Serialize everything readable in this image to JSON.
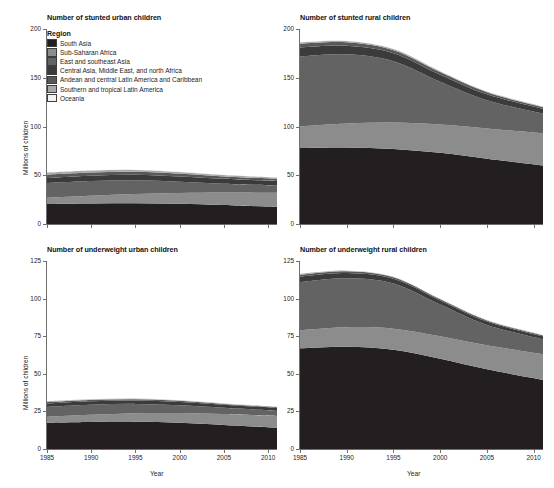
{
  "figure": {
    "ylabel": "Millions of children",
    "xlabel": "Year"
  },
  "legend": {
    "title": "Region",
    "items": [
      {
        "label": "South Asia",
        "color": "#231f20"
      },
      {
        "label": "Sub-Saharan Africa",
        "color": "#8c8c8c"
      },
      {
        "label": "East and southeast Asia",
        "color": "#636363"
      },
      {
        "label": "Central Asia, Middle East, and north Africa",
        "color": "#3b3b3b"
      },
      {
        "label": "Andean and central Latin America and Caribbean",
        "color": "#585858"
      },
      {
        "label": "Southern and tropical Latin America",
        "color": "#a8a8a8"
      },
      {
        "label": "Oceania",
        "color": "#f2f2f2"
      }
    ]
  },
  "chart_data": [
    {
      "type": "area",
      "id": "stunted-urban",
      "title": "Number of stunted urban children",
      "xlabel": "Year",
      "ylabel": "Millions of children",
      "x": [
        1985,
        1990,
        1995,
        2000,
        2005,
        2011
      ],
      "xlim": [
        1985,
        2011
      ],
      "ylim": [
        0,
        200
      ],
      "yticks": [
        0,
        50,
        100,
        150,
        200
      ],
      "xticks": [
        1985,
        1990,
        1995,
        2000,
        2005,
        2010
      ],
      "grid": false,
      "legend_position": "inside-top-left",
      "stacked": true,
      "series": [
        {
          "name": "South Asia",
          "color": "#231f20",
          "values": [
            20.5,
            21.0,
            21.3,
            20.8,
            19.5,
            17.5
          ]
        },
        {
          "name": "Sub-Saharan Africa",
          "color": "#8c8c8c",
          "values": [
            6.5,
            8.0,
            9.5,
            11.0,
            12.8,
            14.5
          ]
        },
        {
          "name": "East and southeast Asia",
          "color": "#636363",
          "values": [
            15.0,
            15.0,
            14.0,
            11.5,
            9.0,
            7.5
          ]
        },
        {
          "name": "Central Asia, Middle East, and north Africa",
          "color": "#3b3b3b",
          "values": [
            5.2,
            5.5,
            5.6,
            5.4,
            5.0,
            4.6
          ]
        },
        {
          "name": "Andean and central Latin America and Caribbean",
          "color": "#585858",
          "values": [
            3.4,
            3.3,
            3.1,
            2.8,
            2.5,
            2.2
          ]
        },
        {
          "name": "Southern and tropical Latin America",
          "color": "#a8a8a8",
          "values": [
            2.3,
            2.2,
            2.0,
            1.8,
            1.5,
            1.3
          ]
        },
        {
          "name": "Oceania",
          "color": "#f2f2f2",
          "values": [
            0.2,
            0.2,
            0.2,
            0.2,
            0.2,
            0.2
          ]
        }
      ]
    },
    {
      "type": "area",
      "id": "stunted-rural",
      "title": "Number of stunted rural children",
      "xlabel": "Year",
      "ylabel": "Millions of children",
      "x": [
        1985,
        1990,
        1995,
        2000,
        2005,
        2011
      ],
      "xlim": [
        1985,
        2011
      ],
      "ylim": [
        0,
        200
      ],
      "yticks": [
        0,
        50,
        100,
        150,
        200
      ],
      "xticks": [
        1985,
        1990,
        1995,
        2000,
        2005,
        2010
      ],
      "grid": false,
      "stacked": true,
      "series": [
        {
          "name": "South Asia",
          "color": "#231f20",
          "values": [
            78.0,
            78.5,
            77.0,
            73.0,
            67.0,
            60.0
          ]
        },
        {
          "name": "Sub-Saharan Africa",
          "color": "#8c8c8c",
          "values": [
            22.0,
            24.5,
            27.0,
            29.0,
            31.0,
            33.0
          ]
        },
        {
          "name": "East and southeast Asia",
          "color": "#636363",
          "values": [
            72.0,
            71.0,
            63.0,
            44.0,
            29.0,
            20.0
          ]
        },
        {
          "name": "Central Asia, Middle East, and north Africa",
          "color": "#3b3b3b",
          "values": [
            9.0,
            8.8,
            8.2,
            7.2,
            6.0,
            5.0
          ]
        },
        {
          "name": "Andean and central Latin America and Caribbean",
          "color": "#585858",
          "values": [
            4.0,
            3.6,
            3.1,
            2.6,
            2.2,
            1.8
          ]
        },
        {
          "name": "Southern and tropical Latin America",
          "color": "#a8a8a8",
          "values": [
            1.5,
            1.3,
            1.1,
            0.9,
            0.7,
            0.6
          ]
        },
        {
          "name": "Oceania",
          "color": "#f2f2f2",
          "values": [
            0.3,
            0.3,
            0.3,
            0.3,
            0.3,
            0.3
          ]
        }
      ]
    },
    {
      "type": "area",
      "id": "underweight-urban",
      "title": "Number of underweight urban children",
      "xlabel": "Year",
      "ylabel": "Millions of children",
      "x": [
        1985,
        1990,
        1995,
        2000,
        2005,
        2011
      ],
      "xlim": [
        1985,
        2011
      ],
      "ylim": [
        0,
        125
      ],
      "yticks": [
        0,
        25,
        50,
        75,
        100,
        125
      ],
      "xticks": [
        1985,
        1990,
        1995,
        2000,
        2005,
        2010
      ],
      "grid": false,
      "stacked": true,
      "series": [
        {
          "name": "South Asia",
          "color": "#231f20",
          "values": [
            17.5,
            18.0,
            18.2,
            17.5,
            16.0,
            14.0
          ]
        },
        {
          "name": "Sub-Saharan Africa",
          "color": "#8c8c8c",
          "values": [
            4.0,
            4.8,
            5.6,
            6.4,
            7.2,
            8.0
          ]
        },
        {
          "name": "East and southeast Asia",
          "color": "#636363",
          "values": [
            6.5,
            6.6,
            6.2,
            5.2,
            4.2,
            3.5
          ]
        },
        {
          "name": "Central Asia, Middle East, and north Africa",
          "color": "#3b3b3b",
          "values": [
            2.2,
            2.3,
            2.3,
            2.2,
            2.0,
            1.8
          ]
        },
        {
          "name": "Andean and central Latin America and Caribbean",
          "color": "#585858",
          "values": [
            1.0,
            0.9,
            0.8,
            0.7,
            0.6,
            0.5
          ]
        },
        {
          "name": "Southern and tropical Latin America",
          "color": "#a8a8a8",
          "values": [
            0.6,
            0.5,
            0.5,
            0.4,
            0.3,
            0.3
          ]
        },
        {
          "name": "Oceania",
          "color": "#f2f2f2",
          "values": [
            0.1,
            0.1,
            0.1,
            0.1,
            0.1,
            0.1
          ]
        }
      ]
    },
    {
      "type": "area",
      "id": "underweight-rural",
      "title": "Number of underweight rural children",
      "xlabel": "Year",
      "ylabel": "Millions of children",
      "x": [
        1985,
        1990,
        1995,
        2000,
        2005,
        2011
      ],
      "xlim": [
        1985,
        2011
      ],
      "ylim": [
        0,
        125
      ],
      "yticks": [
        0,
        25,
        50,
        75,
        100,
        125
      ],
      "xticks": [
        1985,
        1990,
        1995,
        2000,
        2005,
        2010
      ],
      "grid": false,
      "stacked": true,
      "series": [
        {
          "name": "South Asia",
          "color": "#231f20",
          "values": [
            67.0,
            68.0,
            66.0,
            60.0,
            53.0,
            46.0
          ]
        },
        {
          "name": "Sub-Saharan Africa",
          "color": "#8c8c8c",
          "values": [
            12.0,
            13.0,
            14.0,
            15.0,
            16.0,
            17.0
          ]
        },
        {
          "name": "East and southeast Asia",
          "color": "#636363",
          "values": [
            32.0,
            32.5,
            30.0,
            21.0,
            13.5,
            10.0
          ]
        },
        {
          "name": "Central Asia, Middle East, and north Africa",
          "color": "#3b3b3b",
          "values": [
            3.6,
            3.5,
            3.2,
            2.8,
            2.3,
            1.9
          ]
        },
        {
          "name": "Andean and central Latin America and Caribbean",
          "color": "#585858",
          "values": [
            1.3,
            1.2,
            1.0,
            0.8,
            0.7,
            0.6
          ]
        },
        {
          "name": "Southern and tropical Latin America",
          "color": "#a8a8a8",
          "values": [
            0.5,
            0.4,
            0.4,
            0.3,
            0.3,
            0.2
          ]
        },
        {
          "name": "Oceania",
          "color": "#f2f2f2",
          "values": [
            0.1,
            0.1,
            0.1,
            0.1,
            0.1,
            0.1
          ]
        }
      ]
    }
  ]
}
